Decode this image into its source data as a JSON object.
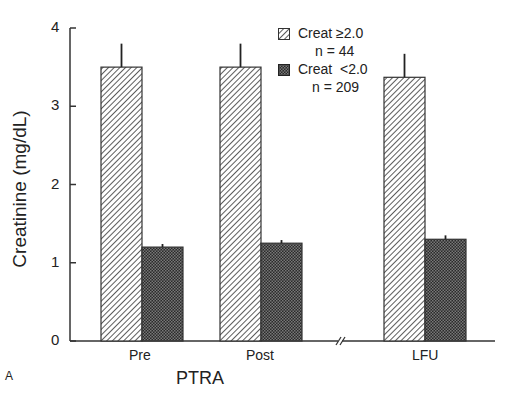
{
  "chart_data": {
    "type": "bar",
    "title": "",
    "panel_label": "A",
    "xlabel": "PTRA",
    "ylabel": "Creatinine (mg/dL)",
    "ylim": [
      0,
      4
    ],
    "yticks": [
      "0",
      "1",
      "2",
      "3",
      "4"
    ],
    "categories": [
      "Pre",
      "Post",
      "LFU"
    ],
    "axis_break_between": [
      "Post",
      "LFU"
    ],
    "grid": false,
    "legend_position": "upper-right",
    "series": [
      {
        "name": "Creat ≥2.0",
        "n_label": "n=44",
        "pattern": "diagonal-hatch",
        "values": [
          3.5,
          3.5,
          3.37
        ],
        "error_upper": [
          3.8,
          3.8,
          3.67
        ]
      },
      {
        "name": "Creat <2.0",
        "n_label": "n=209",
        "pattern": "dark-checker",
        "values": [
          1.2,
          1.25,
          1.3
        ],
        "error_upper": [
          1.24,
          1.29,
          1.35
        ]
      }
    ]
  },
  "labels": {
    "y_axis": "Creatinine (mg/dL)",
    "x_axis": "PTRA",
    "panel": "A",
    "ticks": [
      "0",
      "1",
      "2",
      "3",
      "4"
    ],
    "cats": [
      "Pre",
      "Post",
      "LFU"
    ],
    "legend": [
      {
        "name": "Creat ≥2.0",
        "n": "n = 44"
      },
      {
        "name": "Creat  <2.0",
        "n": "n = 209"
      }
    ]
  }
}
